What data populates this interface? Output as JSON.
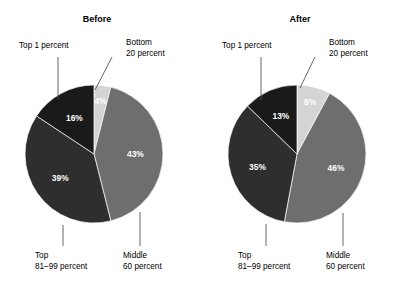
{
  "figure": {
    "background": "#ffffff",
    "width": 401,
    "height": 285
  },
  "legend_colors": {
    "bottom_20": "#d4d4d4",
    "middle_60": "#6e6e6e",
    "top_81_99": "#2e2e2e",
    "top_1": "#1a1a1a",
    "leader_line": "#555555",
    "label_text": "#000000",
    "value_text": "#ffffff"
  },
  "panels": [
    {
      "id": "before",
      "title": "Before",
      "title_x": 97,
      "title_y": 22,
      "center_x": 94,
      "center_y": 154,
      "radius": 69,
      "callouts": {
        "top1": {
          "line1": "Top 1 percent",
          "line2": "",
          "x": 19,
          "y": 48
        },
        "bottom20": {
          "line1": "Bottom",
          "line2": "20 percent",
          "x": 126,
          "y": 45
        },
        "top8199": {
          "line1": "Top",
          "line2": "81–99 percent",
          "x": 35,
          "y": 258
        },
        "middle60": {
          "line1": "Middle",
          "line2": "60 percent",
          "x": 123,
          "y": 258
        }
      }
    },
    {
      "id": "after",
      "title": "After",
      "title_x": 300,
      "title_y": 22,
      "center_x": 297,
      "center_y": 154,
      "radius": 69,
      "callouts": {
        "top1": {
          "line1": "Top 1 percent",
          "line2": "",
          "x": 222,
          "y": 48
        },
        "bottom20": {
          "line1": "Bottom",
          "line2": "20 percent",
          "x": 329,
          "y": 45
        },
        "top8199": {
          "line1": "Top",
          "line2": "81–99 percent",
          "x": 238,
          "y": 258
        },
        "middle60": {
          "line1": "Middle",
          "line2": "60 percent",
          "x": 326,
          "y": 258
        }
      }
    }
  ],
  "chart_data": {
    "type": "pie",
    "title": "",
    "subtitle": "",
    "legend_position": "callout-labels",
    "grid": false,
    "note": "Two pie charts comparing income share distribution Before and After. Slices ordered clockwise starting at 12 o'clock.",
    "categories": [
      "Bottom 20 percent",
      "Middle 60 percent",
      "Top 81–99 percent",
      "Top 1 percent"
    ],
    "category_colors": [
      "#d4d4d4",
      "#6e6e6e",
      "#2e2e2e",
      "#1a1a1a"
    ],
    "series": [
      {
        "name": "Before",
        "values": [
          4,
          43,
          39,
          16
        ],
        "labels": [
          "4%",
          "43%",
          "39%",
          "16%"
        ]
      },
      {
        "name": "After",
        "values": [
          8,
          46,
          35,
          13
        ],
        "labels": [
          "8%",
          "46%",
          "35%",
          "13%"
        ]
      }
    ]
  }
}
